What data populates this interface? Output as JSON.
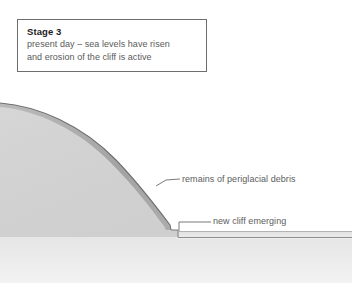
{
  "figure": {
    "width": 352,
    "height": 283,
    "background": "#ffffff"
  },
  "caption": {
    "stage_label": "Stage 3",
    "line_1": "present day – sea levels have risen",
    "line_2": "and erosion of the cliff is active",
    "border_color": "#6e6e6e",
    "text_color": "#5a5a5a"
  },
  "annotations": [
    {
      "id": "remains-of-periglacial-debris",
      "text": "remains of periglacial debris",
      "leader_from": [
        157,
        185
      ],
      "leader_to": [
        180,
        178
      ]
    },
    {
      "id": "new-cliff-emerging",
      "text": "new cliff emerging",
      "leader_from": [
        180,
        228
      ],
      "leader_to": [
        211,
        221
      ]
    }
  ],
  "landform": {
    "cliff_mass_fill_light": "#dcdcdc",
    "cliff_mass_fill_dark": "#c9c9c9",
    "debris_band_fill": "#9a9a9a",
    "outline_color": "#6f6f6f",
    "platform_fill": "#ececec",
    "platform_line_color": "#8d8d8d",
    "foreshore_fill": "#efefef",
    "cliff_top_start": [
      0,
      103
    ],
    "cliff_base_x": 178,
    "platform_y": 237
  }
}
